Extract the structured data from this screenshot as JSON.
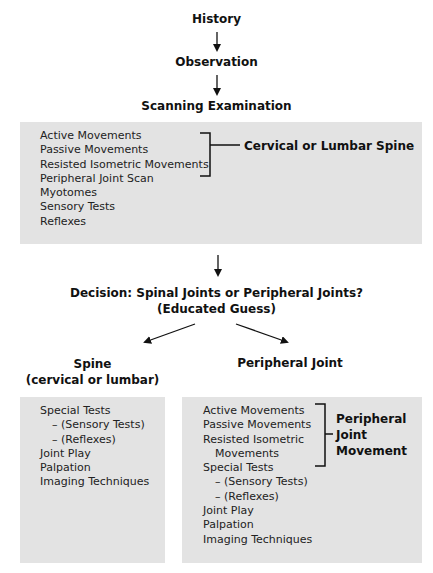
{
  "flow": {
    "step1": "History",
    "step2": "Observation",
    "step3": "Scanning Examination"
  },
  "scanning_box": {
    "items": [
      "Active Movements",
      "Passive Movements",
      "Resisted Isometric Movements",
      "Peripheral Joint Scan",
      "Myotomes",
      "Sensory Tests",
      "Reflexes"
    ],
    "bracket_label": "Cervical or Lumbar Spine"
  },
  "decision": {
    "line1": "Decision: Spinal Joints or Peripheral Joints?",
    "line2": "(Educated Guess)"
  },
  "spine": {
    "title_line1": "Spine",
    "title_line2": "(cervical or lumbar)",
    "items": [
      "Special Tests",
      "– (Sensory Tests)",
      "– (Reflexes)",
      "Joint Play",
      "Palpation",
      "Imaging Techniques"
    ]
  },
  "peripheral": {
    "title": "Peripheral Joint",
    "items": [
      "Active Movements",
      "Passive Movements",
      "Resisted Isometric",
      "Movements",
      "Special Tests",
      "– (Sensory Tests)",
      "– (Reflexes)",
      "Joint Play",
      "Palpation",
      "Imaging Techniques"
    ],
    "bracket_label_line1": "Peripheral",
    "bracket_label_line2": "Joint",
    "bracket_label_line3": "Movement"
  }
}
